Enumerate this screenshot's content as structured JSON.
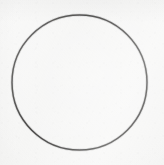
{
  "canvas": {
    "width": 164,
    "height": 165,
    "background_color": "#f6f6f5",
    "description": "Hand-drawn circle outline on plain off-white paper"
  },
  "shapes": [
    {
      "name": "circle-outline",
      "type": "circle",
      "center_x": 79.5,
      "center_y": 82.5,
      "radius": 67.5,
      "stroke_color": "#2e2d2c",
      "stroke_width": 1.5,
      "fill": "none"
    }
  ],
  "labels": {
    "canvas_title": "",
    "shape_label": ""
  }
}
